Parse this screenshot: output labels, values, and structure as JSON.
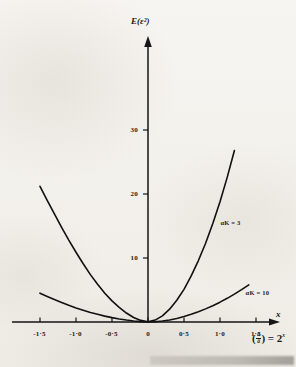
{
  "figure": {
    "background_color": "#f2efe9",
    "ink_color": "#111111"
  },
  "chart_data": {
    "type": "line",
    "title": "",
    "subtitle": "",
    "ylabel": "E(ε²)",
    "xlabel": "x",
    "xlabel_formula_prefix": "(",
    "xlabel_formula_num": "a",
    "xlabel_formula_den": "ā",
    "xlabel_formula_suffix": ") = 2",
    "xlabel_formula_exponent": "x",
    "xlim": [
      -1.6,
      1.55
    ],
    "ylim": [
      0,
      32
    ],
    "grid": false,
    "legend": "inline-annotations",
    "x_ticks": [
      {
        "value": -1.5,
        "label": "-1·5"
      },
      {
        "value": -1.0,
        "label": "-1·0"
      },
      {
        "value": -0.5,
        "label": "-0·5"
      },
      {
        "value": 0.0,
        "label": "0"
      },
      {
        "value": 0.5,
        "label": "0·5"
      },
      {
        "value": 1.0,
        "label": "1·0"
      },
      {
        "value": 1.5,
        "label": "1·5"
      }
    ],
    "y_ticks": [
      {
        "value": 10,
        "label": "10"
      },
      {
        "value": 20,
        "label": "20"
      },
      {
        "value": 30,
        "label": "30"
      }
    ],
    "series": [
      {
        "name": "αK = 3",
        "label": "αK = 3",
        "label_x": 0.95,
        "label_y": 15.5,
        "x": [
          -1.5,
          -1.4,
          -1.3,
          -1.2,
          -1.1,
          -1.0,
          -0.9,
          -0.8,
          -0.7,
          -0.6,
          -0.5,
          -0.4,
          -0.3,
          -0.2,
          -0.1,
          0.0,
          0.1,
          0.2,
          0.3,
          0.4,
          0.5,
          0.6,
          0.7,
          0.8,
          0.9,
          1.0,
          1.1,
          1.2
        ],
        "values": [
          21.2,
          19.0,
          16.9,
          14.8,
          12.8,
          10.9,
          9.1,
          7.4,
          5.9,
          4.5,
          3.3,
          2.3,
          1.4,
          0.7,
          0.25,
          0.05,
          0.3,
          0.95,
          2.0,
          3.4,
          5.1,
          7.2,
          9.6,
          12.3,
          15.4,
          18.8,
          22.6,
          26.8
        ]
      },
      {
        "name": "αK = 10",
        "label": "αK = 10",
        "label_x": 1.3,
        "label_y": 4.6,
        "x": [
          -1.5,
          -1.4,
          -1.3,
          -1.2,
          -1.1,
          -1.0,
          -0.9,
          -0.8,
          -0.7,
          -0.6,
          -0.5,
          -0.4,
          -0.3,
          -0.2,
          -0.1,
          0.0,
          0.1,
          0.2,
          0.3,
          0.4,
          0.5,
          0.6,
          0.7,
          0.8,
          0.9,
          1.0,
          1.1,
          1.2,
          1.3,
          1.4
        ],
        "values": [
          4.5,
          4.0,
          3.5,
          3.05,
          2.6,
          2.2,
          1.85,
          1.5,
          1.2,
          0.92,
          0.68,
          0.47,
          0.3,
          0.16,
          0.06,
          0.02,
          0.05,
          0.15,
          0.32,
          0.55,
          0.85,
          1.2,
          1.6,
          2.05,
          2.55,
          3.1,
          3.7,
          4.35,
          5.05,
          5.8
        ]
      }
    ]
  }
}
